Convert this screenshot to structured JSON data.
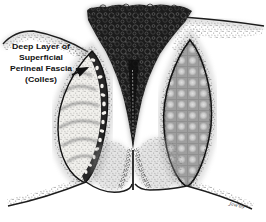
{
  "figure": {
    "label": {
      "lines": [
        "Deep Layer of",
        "Superficial",
        "Perineal Fascia",
        "(Colles)"
      ]
    },
    "signature": "Jaw'69",
    "colors": {
      "ink": "#111111",
      "paper": "#ffffff",
      "hair_dark": "#1b1b1b",
      "mesh_gray": "#9e9e9e",
      "fascia_band_dark": "#262626"
    }
  }
}
